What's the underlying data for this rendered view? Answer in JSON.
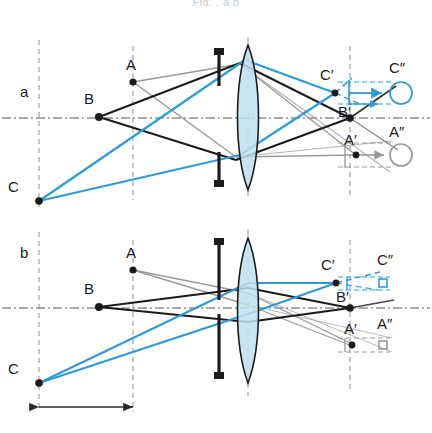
{
  "figure": {
    "cropped_caption_top": "Fig. ,                               a      b",
    "panels": [
      {
        "id": "a",
        "panel_label": "a",
        "object_points": [
          {
            "name": "A",
            "label": "A"
          },
          {
            "name": "B",
            "label": "B"
          },
          {
            "name": "C",
            "label": "C"
          }
        ],
        "image_points": [
          {
            "name": "C-prime",
            "label": "C′"
          },
          {
            "name": "B-prime",
            "label": "B′"
          },
          {
            "name": "A-prime",
            "label": "A′"
          }
        ],
        "blur_circles": [
          {
            "name": "C-double-prime",
            "label": "C″",
            "shape": "large-circle",
            "color": "#2e9bd6"
          },
          {
            "name": "A-double-prime",
            "label": "A″",
            "shape": "large-circle",
            "color": "#9a9a9a"
          }
        ],
        "aperture": {
          "name": "wide-aperture",
          "gap": "wide"
        }
      },
      {
        "id": "b",
        "panel_label": "b",
        "object_points": [
          {
            "name": "A",
            "label": "A"
          },
          {
            "name": "B",
            "label": "B"
          },
          {
            "name": "C",
            "label": "C"
          }
        ],
        "image_points": [
          {
            "name": "C-prime",
            "label": "C′"
          },
          {
            "name": "B-prime",
            "label": "B′"
          },
          {
            "name": "A-prime",
            "label": "A′"
          }
        ],
        "blur_circles": [
          {
            "name": "C-double-prime",
            "label": "C″",
            "shape": "small-square",
            "color": "#2e9bd6"
          },
          {
            "name": "A-double-prime",
            "label": "A″",
            "shape": "small-square",
            "color": "#9a9a9a"
          }
        ],
        "aperture": {
          "name": "narrow-aperture",
          "gap": "narrow"
        },
        "dimension": {
          "name": "object-distance-dimension",
          "label": ""
        }
      }
    ],
    "colors": {
      "ray_blue": "#2e9bd6",
      "ray_black": "#1b1b1b",
      "ray_gray": "#9a9a9a",
      "lens_fill": "#bfe0f0",
      "lens_stroke": "#1b1b1b",
      "axis": "#555555",
      "construction_dash": "#8d8d8d"
    }
  }
}
